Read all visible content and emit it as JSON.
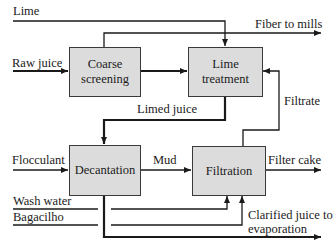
{
  "diagram": {
    "boxes": {
      "coarse_screening": "Coarse screening",
      "lime_treatment": "Lime treatment",
      "decantation": "Decantation",
      "filtration": "Filtration"
    },
    "labels": {
      "lime": "Lime",
      "fiber_to_mills": "Fiber to mills",
      "raw_juice": "Raw juice",
      "limed_juice": "Limed juice",
      "filtrate": "Filtrate",
      "flocculant": "Flocculant",
      "mud": "Mud",
      "filter_cake": "Filter cake",
      "wash_water": "Wash water",
      "bagacilho": "Bagacilho",
      "clarified_juice_line1": "Clarified juice to",
      "clarified_juice_line2": "evaporation"
    },
    "colors": {
      "box_fill": "#dcdcdc",
      "box_border": "#3a3a3a",
      "line": "#1a1a1a"
    }
  }
}
